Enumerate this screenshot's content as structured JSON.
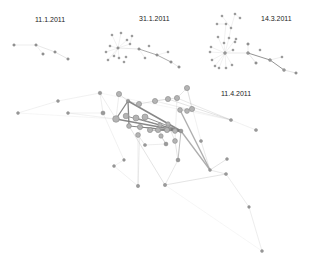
{
  "colors": {
    "background": "#ffffff",
    "node_fill": "#9a9a9a",
    "node_stroke": "#6e6e6e",
    "big_node_fill": "#b4b4b4",
    "big_node_stroke": "#8a8a8a",
    "edge": "#bdbdbd",
    "edge_dark": "#7a7a7a",
    "label": "#222222"
  },
  "snapshots": [
    {
      "label": "11.1.2011",
      "label_pos": [
        51,
        22
      ],
      "nodes": [
        [
          14,
          45,
          1.3
        ],
        [
          36,
          45,
          1.3
        ],
        [
          43,
          54,
          1.3
        ],
        [
          55,
          52,
          1.3
        ],
        [
          68,
          59,
          1.3
        ]
      ],
      "edges": [
        [
          0,
          1,
          0.4,
          "light"
        ],
        [
          1,
          3,
          0.5,
          "light"
        ],
        [
          3,
          4,
          0.6,
          "light"
        ],
        [
          1,
          2,
          0.3,
          "light"
        ]
      ]
    },
    {
      "label": "31.1.2011",
      "label_pos": [
        155,
        21
      ],
      "nodes": [
        [
          118,
          48,
          1.3
        ],
        [
          112,
          35,
          1.1
        ],
        [
          121,
          33,
          1.1
        ],
        [
          127,
          40,
          1.1
        ],
        [
          110,
          46,
          1.1
        ],
        [
          106,
          52,
          1.1
        ],
        [
          114,
          56,
          1.1
        ],
        [
          119,
          58,
          1.1
        ],
        [
          124,
          62,
          1.1
        ],
        [
          108,
          60,
          1.1
        ],
        [
          126,
          57,
          1.1
        ],
        [
          132,
          36,
          1.1
        ],
        [
          139,
          49,
          1.3
        ],
        [
          149,
          46,
          1.1
        ],
        [
          157,
          55,
          1.3
        ],
        [
          145,
          58,
          1.1
        ],
        [
          168,
          52,
          1.1
        ],
        [
          171,
          62,
          1.3
        ],
        [
          179,
          67,
          1.3
        ],
        [
          130,
          44,
          1.1
        ]
      ],
      "edges": [
        [
          0,
          12,
          0.5,
          "light"
        ],
        [
          12,
          14,
          0.7,
          "dark"
        ],
        [
          14,
          17,
          0.7,
          "dark"
        ],
        [
          17,
          18,
          0.5,
          "light"
        ],
        [
          0,
          1,
          0.3,
          "light"
        ],
        [
          0,
          2,
          0.3,
          "light"
        ],
        [
          0,
          3,
          0.3,
          "light"
        ],
        [
          0,
          4,
          0.3,
          "light"
        ],
        [
          0,
          5,
          0.3,
          "light"
        ],
        [
          0,
          6,
          0.3,
          "light"
        ],
        [
          0,
          7,
          0.3,
          "light"
        ],
        [
          0,
          9,
          0.3,
          "light"
        ],
        [
          12,
          15,
          0.3,
          "light"
        ],
        [
          14,
          16,
          0.3,
          "light"
        ],
        [
          0,
          19,
          0.3,
          "light"
        ],
        [
          19,
          11,
          0.3,
          "light"
        ]
      ]
    },
    {
      "label": "14.3.2011",
      "label_pos": [
        277,
        21
      ],
      "nodes": [
        [
          225,
          53,
          1.5
        ],
        [
          222,
          16,
          1.1
        ],
        [
          235,
          14,
          1.1
        ],
        [
          240,
          18,
          1.1
        ],
        [
          217,
          24,
          1.1
        ],
        [
          226,
          24,
          1.1
        ],
        [
          231,
          28,
          1.1
        ],
        [
          218,
          37,
          1.1
        ],
        [
          224,
          43,
          1.1
        ],
        [
          229,
          38,
          1.1
        ],
        [
          236,
          39,
          1.1
        ],
        [
          235,
          42,
          1.1
        ],
        [
          211,
          47,
          1.1
        ],
        [
          210,
          52,
          1.1
        ],
        [
          212,
          60,
          1.1
        ],
        [
          215,
          66,
          1.1
        ],
        [
          219,
          68,
          1.1
        ],
        [
          226,
          68,
          1.1
        ],
        [
          232,
          65,
          1.1
        ],
        [
          233,
          50,
          1.1
        ],
        [
          248,
          44,
          1.3
        ],
        [
          248,
          53,
          1.5
        ],
        [
          260,
          50,
          1.1
        ],
        [
          256,
          63,
          1.3
        ],
        [
          270,
          60,
          1.5
        ],
        [
          282,
          57,
          1.1
        ],
        [
          284,
          70,
          1.5
        ],
        [
          296,
          73,
          1.3
        ]
      ],
      "edges": [
        [
          0,
          21,
          0.5,
          "light"
        ],
        [
          21,
          24,
          0.9,
          "dark"
        ],
        [
          24,
          26,
          0.9,
          "dark"
        ],
        [
          26,
          27,
          0.6,
          "light"
        ],
        [
          21,
          23,
          0.5,
          "light"
        ],
        [
          24,
          25,
          0.4,
          "light"
        ],
        [
          21,
          20,
          0.4,
          "light"
        ],
        [
          0,
          7,
          0.3,
          "light"
        ],
        [
          0,
          8,
          0.3,
          "light"
        ],
        [
          0,
          9,
          0.3,
          "light"
        ],
        [
          0,
          10,
          0.3,
          "light"
        ],
        [
          0,
          12,
          0.3,
          "light"
        ],
        [
          0,
          13,
          0.3,
          "light"
        ],
        [
          0,
          14,
          0.3,
          "light"
        ],
        [
          0,
          15,
          0.3,
          "light"
        ],
        [
          0,
          16,
          0.3,
          "light"
        ],
        [
          0,
          17,
          0.3,
          "light"
        ],
        [
          0,
          18,
          0.3,
          "light"
        ],
        [
          0,
          19,
          0.3,
          "light"
        ],
        [
          8,
          5,
          0.3,
          "light"
        ],
        [
          5,
          4,
          0.3,
          "light"
        ],
        [
          6,
          1,
          0.3,
          "light"
        ],
        [
          6,
          2,
          0.3,
          "light"
        ],
        [
          9,
          6,
          0.3,
          "light"
        ],
        [
          11,
          10,
          0.3,
          "light"
        ],
        [
          2,
          3,
          0.3,
          "light"
        ]
      ]
    },
    {
      "label": "11.4.2011",
      "label_pos": [
        237,
        96
      ],
      "nodes": [
        [
          100,
          93,
          1.8
        ],
        [
          119,
          94,
          2.6
        ],
        [
          18,
          113,
          1.5
        ],
        [
          103,
          113,
          2.1
        ],
        [
          128,
          101,
          1.8
        ],
        [
          139,
          104,
          2.6
        ],
        [
          155,
          101,
          2.6
        ],
        [
          168,
          99,
          2.6
        ],
        [
          177,
          98,
          2.6
        ],
        [
          187,
          88,
          2.6
        ],
        [
          192,
          109,
          2.6
        ],
        [
          180,
          110,
          2.4
        ],
        [
          187,
          111,
          2.4
        ],
        [
          116,
          119,
          3.3
        ],
        [
          126,
          116,
          2.8
        ],
        [
          136,
          118,
          3.0
        ],
        [
          145,
          117,
          3.0
        ],
        [
          129,
          126,
          2.4
        ],
        [
          140,
          127,
          2.6
        ],
        [
          150,
          130,
          2.6
        ],
        [
          158,
          130,
          2.6
        ],
        [
          167,
          130,
          2.6
        ],
        [
          175,
          131,
          2.4
        ],
        [
          181,
          131,
          2.0
        ],
        [
          138,
          135,
          2.4
        ],
        [
          160,
          125,
          2.2
        ],
        [
          161,
          136,
          2.2
        ],
        [
          166,
          144,
          2.0
        ],
        [
          175,
          141,
          2.4
        ],
        [
          168,
          124,
          2.2
        ],
        [
          231,
          120,
          1.6
        ],
        [
          256,
          130,
          1.6
        ],
        [
          201,
          141,
          1.6
        ],
        [
          227,
          159,
          1.5
        ],
        [
          210,
          170,
          1.5
        ],
        [
          178,
          160,
          2.0
        ],
        [
          165,
          185,
          1.7
        ],
        [
          138,
          186,
          1.7
        ],
        [
          145,
          145,
          1.6
        ],
        [
          124,
          160,
          1.4
        ],
        [
          114,
          166,
          1.5
        ],
        [
          226,
          174,
          1.6
        ],
        [
          249,
          207,
          1.4
        ],
        [
          262,
          251,
          1.5
        ],
        [
          58,
          101,
          1.5
        ],
        [
          68,
          113,
          1.5
        ]
      ],
      "edges": [
        [
          0,
          3,
          0.4,
          "light"
        ],
        [
          0,
          13,
          0.4,
          "light"
        ],
        [
          0,
          44,
          0.3,
          "light"
        ],
        [
          44,
          2,
          0.3,
          "light"
        ],
        [
          1,
          4,
          0.6,
          "light"
        ],
        [
          4,
          13,
          1.3,
          "dark"
        ],
        [
          4,
          17,
          1.3,
          "dark"
        ],
        [
          4,
          5,
          0.6,
          "light"
        ],
        [
          5,
          6,
          0.6,
          "light"
        ],
        [
          6,
          7,
          0.8,
          "light"
        ],
        [
          7,
          8,
          0.6,
          "light"
        ],
        [
          8,
          9,
          0.5,
          "light"
        ],
        [
          9,
          10,
          0.5,
          "light"
        ],
        [
          10,
          11,
          0.5,
          "light"
        ],
        [
          11,
          12,
          0.5,
          "light"
        ],
        [
          4,
          23,
          1.5,
          "dark"
        ],
        [
          13,
          23,
          1.3,
          "dark"
        ],
        [
          17,
          23,
          1.1,
          "dark"
        ],
        [
          14,
          23,
          0.9,
          "dark"
        ],
        [
          15,
          23,
          0.9,
          "dark"
        ],
        [
          16,
          23,
          0.9,
          "dark"
        ],
        [
          18,
          23,
          0.8,
          "dark"
        ],
        [
          19,
          23,
          0.8,
          "dark"
        ],
        [
          20,
          23,
          0.8,
          "dark"
        ],
        [
          21,
          23,
          0.8,
          "dark"
        ],
        [
          22,
          23,
          0.8,
          "dark"
        ],
        [
          7,
          30,
          0.6,
          "light"
        ],
        [
          8,
          30,
          0.5,
          "light"
        ],
        [
          6,
          30,
          0.4,
          "light"
        ],
        [
          30,
          31,
          0.3,
          "light"
        ],
        [
          11,
          34,
          1.4,
          "mid"
        ],
        [
          34,
          33,
          0.6,
          "light"
        ],
        [
          34,
          32,
          0.5,
          "light"
        ],
        [
          8,
          28,
          0.4,
          "light"
        ],
        [
          23,
          34,
          1.3,
          "mid"
        ],
        [
          23,
          35,
          0.8,
          "mid"
        ],
        [
          35,
          36,
          0.5,
          "light"
        ],
        [
          28,
          35,
          0.6,
          "light"
        ],
        [
          17,
          36,
          0.6,
          "light"
        ],
        [
          18,
          37,
          0.4,
          "light"
        ],
        [
          24,
          37,
          0.4,
          "light"
        ],
        [
          37,
          40,
          0.3,
          "light"
        ],
        [
          24,
          38,
          0.5,
          "light"
        ],
        [
          38,
          27,
          0.4,
          "light"
        ],
        [
          26,
          27,
          0.6,
          "mid"
        ],
        [
          36,
          41,
          0.6,
          "light"
        ],
        [
          41,
          42,
          0.4,
          "light"
        ],
        [
          42,
          43,
          0.4,
          "light"
        ],
        [
          34,
          41,
          0.5,
          "light"
        ],
        [
          45,
          13,
          0.3,
          "light"
        ],
        [
          45,
          3,
          0.3,
          "light"
        ],
        [
          1,
          13,
          0.4,
          "light"
        ],
        [
          9,
          32,
          0.3,
          "light"
        ],
        [
          3,
          39,
          0.3,
          "light"
        ],
        [
          39,
          40,
          0.3,
          "light"
        ],
        [
          25,
          26,
          0.5,
          "light"
        ],
        [
          29,
          28,
          0.5,
          "light"
        ],
        [
          2,
          13,
          0.2,
          "light"
        ],
        [
          0,
          30,
          0.2,
          "light"
        ],
        [
          36,
          43,
          0.2,
          "light"
        ]
      ]
    }
  ]
}
